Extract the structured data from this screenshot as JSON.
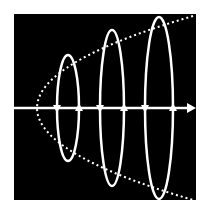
{
  "diagram": {
    "colors": {
      "background": "#ffffff",
      "panel": "#000000",
      "stroke": "#ffffff"
    },
    "panel": {
      "x": 14,
      "y": 14,
      "width": 182,
      "height": 186
    },
    "axis": {
      "y": 108,
      "x_start": 14,
      "x_end": 196,
      "arrow": "right"
    },
    "envelope": {
      "style": "dotted",
      "vertex": {
        "x": 37,
        "y": 108
      },
      "top_end": {
        "x": 193,
        "y": 16
      },
      "bottom_end": {
        "x": 193,
        "y": 200
      }
    },
    "loops": [
      {
        "cx": 68,
        "cy": 108,
        "rx": 11,
        "ry": 53,
        "left_arrow": "down",
        "right_arrow": "up"
      },
      {
        "cx": 112,
        "cy": 108,
        "rx": 12,
        "ry": 78,
        "left_arrow": "down",
        "right_arrow": "up"
      },
      {
        "cx": 159,
        "cy": 108,
        "rx": 14,
        "ry": 91,
        "left_arrow": "down",
        "right_arrow": "up"
      }
    ]
  }
}
